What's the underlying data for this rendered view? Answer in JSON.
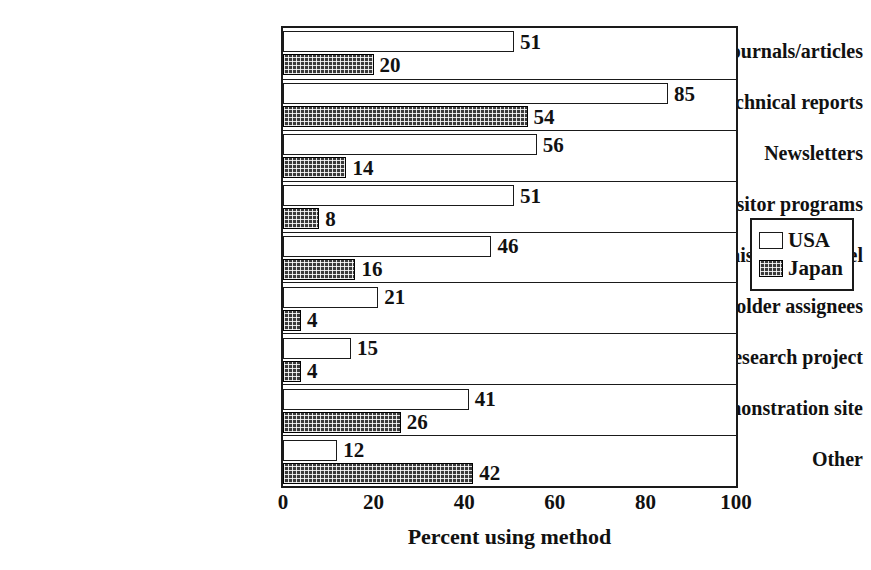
{
  "chart_data": {
    "type": "bar",
    "orientation": "horizontal",
    "title": "",
    "xlabel": "Percent using method",
    "ylabel": "",
    "xlim": [
      0,
      100
    ],
    "xticks": [
      0,
      20,
      40,
      60,
      80,
      100
    ],
    "grid": false,
    "legend_position": "right-outside",
    "categories": [
      "Journals/articles",
      "Technical reports",
      "Newsletters",
      "Visitor programs",
      "Liaison personnel",
      "Shareholder assignees",
      "Shadow research project",
      "Demonstration site",
      "Other"
    ],
    "series": [
      {
        "name": "USA",
        "fill": "white",
        "values": [
          51,
          85,
          56,
          51,
          46,
          21,
          15,
          41,
          12
        ]
      },
      {
        "name": "Japan",
        "fill": "dark-crosshatch",
        "values": [
          20,
          54,
          14,
          8,
          16,
          4,
          4,
          26,
          42
        ]
      }
    ]
  },
  "axis": {
    "x_title": "Percent using method",
    "x_tick_labels": [
      "0",
      "20",
      "40",
      "60",
      "80",
      "100"
    ]
  },
  "legend": {
    "entries": [
      {
        "label": "USA"
      },
      {
        "label": "Japan"
      }
    ]
  },
  "colors": {
    "usa_fill": "#ffffff",
    "japan_fill": "#3a3a3a",
    "line": "#1a1a1a",
    "text": "#111111",
    "background": "#ffffff"
  },
  "caption": ""
}
